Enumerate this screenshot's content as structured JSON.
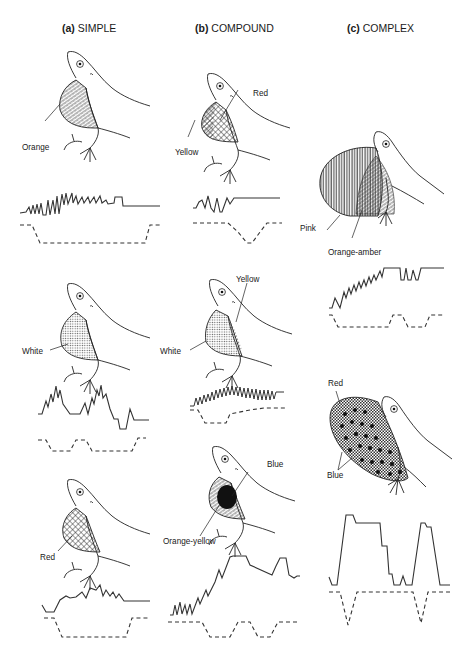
{
  "figure": {
    "columns": [
      {
        "letter": "(a)",
        "title": "SIMPLE"
      },
      {
        "letter": "(b)",
        "title": "COMPOUND"
      },
      {
        "letter": "(c)",
        "title": "COMPLEX"
      }
    ],
    "panels": [
      {
        "id": "a1",
        "column": "SIMPLE",
        "labels": [
          "Orange"
        ]
      },
      {
        "id": "a2",
        "column": "SIMPLE",
        "labels": [
          "White"
        ]
      },
      {
        "id": "a3",
        "column": "SIMPLE",
        "labels": [
          "Red"
        ]
      },
      {
        "id": "b1",
        "column": "COMPOUND",
        "labels": [
          "Red",
          "Yellow"
        ]
      },
      {
        "id": "b2",
        "column": "COMPOUND",
        "labels": [
          "Yellow",
          "White"
        ]
      },
      {
        "id": "b3",
        "column": "COMPOUND",
        "labels": [
          "Blue",
          "Orange-yellow"
        ]
      },
      {
        "id": "c1",
        "column": "COMPLEX",
        "labels": [
          "Pink",
          "Orange-amber"
        ]
      },
      {
        "id": "c2",
        "column": "COMPLEX",
        "labels": [
          "Red",
          "Blue"
        ]
      }
    ],
    "legend_note": "Solid trace = display action pattern; dashed trace = dewlap extension"
  },
  "colors": {
    "ink": "#1a1a1a",
    "background": "#ffffff"
  }
}
